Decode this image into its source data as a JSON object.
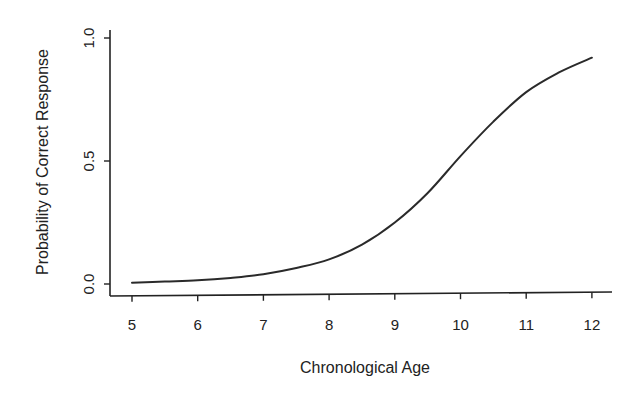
{
  "chart_data": {
    "type": "line",
    "title": "",
    "xlabel": "Chronological Age",
    "ylabel": "Probability of Correct Response",
    "xlim": [
      5,
      12
    ],
    "ylim": [
      0.0,
      1.0
    ],
    "x_ticks": [
      "5",
      "6",
      "7",
      "8",
      "9",
      "10",
      "11",
      "12"
    ],
    "y_ticks": [
      "0.0",
      "0.5",
      "1.0"
    ],
    "grid": false,
    "legend": null,
    "series": [
      {
        "name": "Probability of Correct Response",
        "x": [
          5,
          5.5,
          6,
          6.5,
          7,
          7.5,
          8,
          8.5,
          9,
          9.5,
          10,
          10.5,
          11,
          11.5,
          12
        ],
        "values": [
          0.005,
          0.01,
          0.015,
          0.025,
          0.04,
          0.065,
          0.1,
          0.16,
          0.25,
          0.37,
          0.52,
          0.66,
          0.78,
          0.86,
          0.92
        ]
      }
    ]
  },
  "axes": {
    "x_title": "Chronological Age",
    "y_title": "Probability of Correct Response"
  }
}
